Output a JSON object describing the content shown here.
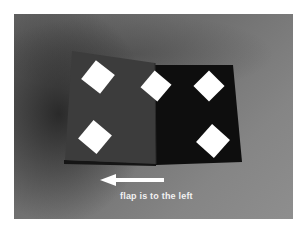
{
  "photo": {
    "description": "Photograph of a folded dark card with white diamond cutouts on a gray background",
    "background_colors": {
      "light": "#8e8e8e",
      "mid": "#6e6e6e",
      "shadow": "#2a2a2a"
    },
    "card": {
      "left_flap_color": "#3c3c3c",
      "right_panel_color": "#0e0e0e",
      "diamond_color": "#ffffff",
      "diamonds": [
        {
          "panel": "left",
          "position": "top",
          "cx": 98,
          "cy": 77
        },
        {
          "panel": "left",
          "position": "bottom",
          "cx": 95,
          "cy": 137
        },
        {
          "panel": "fold",
          "position": "top",
          "cx": 156,
          "cy": 86
        },
        {
          "panel": "right",
          "position": "top",
          "cx": 209,
          "cy": 86
        },
        {
          "panel": "right",
          "position": "bottom",
          "cx": 213,
          "cy": 141
        }
      ]
    },
    "annotation": {
      "arrow_direction": "left",
      "arrow_color": "#ffffff",
      "caption": "flap is to the left"
    }
  }
}
